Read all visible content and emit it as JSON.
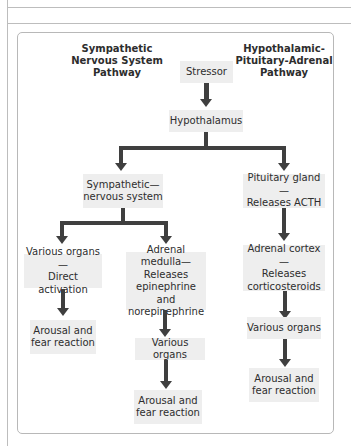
{
  "diagram": {
    "headings": {
      "left": "Sympathetic\nNervous System\nPathway",
      "right": "Hypothalamic-\nPituitary-Adrenal\nPathway"
    },
    "nodes": {
      "stressor": "Stressor",
      "hypothalamus": "Hypothalamus",
      "sympathetic": "Sympathetic—\nnervous system",
      "pituitary": "Pituitary gland—\nReleases ACTH",
      "various_direct": "Various organs—\nDirect activation",
      "adrenal_medulla": "Adrenal medulla—\nReleases\nepinephrine and\nnorepinephrine",
      "adrenal_cortex": "Adrenal cortex—\nReleases\ncorticosteroids",
      "arousal_left": "Arousal and\nfear reaction",
      "various_mid": "Various organs",
      "various_right": "Various organs",
      "arousal_mid": "Arousal and\nfear reaction",
      "arousal_right": "Arousal and\nfear reaction"
    },
    "colors": {
      "box_fill": "#eeeeee",
      "arrow": "#3f3f3f",
      "frame": "#b8b8b8"
    }
  }
}
